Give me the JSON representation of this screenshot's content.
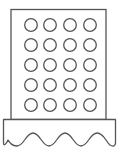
{
  "icon": {
    "name": "pastry-tray-icon",
    "stroke_color": "#555555",
    "fill_color": "#ffffff",
    "grid": {
      "columns": [
        31,
        50,
        70,
        90
      ],
      "rows": [
        25,
        45,
        65,
        85,
        105
      ],
      "radius": 6.3
    }
  }
}
